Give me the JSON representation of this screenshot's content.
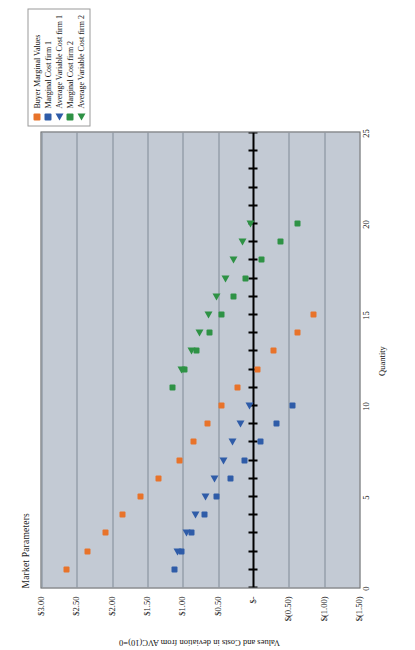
{
  "chart_data": {
    "type": "scatter",
    "title": "Market Parameters",
    "xlabel": "Quantity",
    "ylabel": "Values and Costs in deviation from AVC(10)=0",
    "xlim": [
      0,
      25
    ],
    "ylim": [
      -1.5,
      3.0
    ],
    "xticks": [
      "0",
      "5",
      "10",
      "15",
      "20",
      "25"
    ],
    "xtick_values": [
      0,
      5,
      10,
      15,
      20,
      25
    ],
    "yticks": [
      "$3.00",
      "$2.50",
      "$2.00",
      "$1.50",
      "$1.00",
      "$0.50",
      "$-",
      "$(0.50)",
      "$(1.00)",
      "$(1.50)"
    ],
    "ytick_values": [
      3.0,
      2.5,
      2.0,
      1.5,
      1.0,
      0.5,
      0.0,
      -0.5,
      -1.0,
      -1.5
    ],
    "grid": "horizontal-gridlines-only",
    "zero_line": 0.0,
    "legend_position": "top-right",
    "plot_background": "#c3cad4",
    "series": [
      {
        "name": "Buyer Marginal Values",
        "marker": "square",
        "color": "#e8732a",
        "points": [
          {
            "x": 1,
            "y": 2.65
          },
          {
            "x": 2,
            "y": 2.35
          },
          {
            "x": 3,
            "y": 2.1
          },
          {
            "x": 4,
            "y": 1.85
          },
          {
            "x": 5,
            "y": 1.6
          },
          {
            "x": 6,
            "y": 1.35
          },
          {
            "x": 7,
            "y": 1.05
          },
          {
            "x": 8,
            "y": 0.85
          },
          {
            "x": 9,
            "y": 0.65
          },
          {
            "x": 10,
            "y": 0.45
          },
          {
            "x": 11,
            "y": 0.22
          },
          {
            "x": 12,
            "y": -0.05
          },
          {
            "x": 13,
            "y": -0.28
          },
          {
            "x": 14,
            "y": -0.62
          },
          {
            "x": 15,
            "y": -0.85
          }
        ]
      },
      {
        "name": "Marginal Cost firm 1",
        "marker": "square",
        "color": "#2f5ca8",
        "points": [
          {
            "x": 1,
            "y": 1.12
          },
          {
            "x": 2,
            "y": 1.02
          },
          {
            "x": 3,
            "y": 0.88
          },
          {
            "x": 4,
            "y": 0.7
          },
          {
            "x": 5,
            "y": 0.52
          },
          {
            "x": 6,
            "y": 0.32
          },
          {
            "x": 7,
            "y": 0.13
          },
          {
            "x": 8,
            "y": -0.1
          },
          {
            "x": 9,
            "y": -0.32
          },
          {
            "x": 10,
            "y": -0.55
          }
        ]
      },
      {
        "name": "Average Variable Cost firm 1",
        "marker": "triangle",
        "color": "#2f5ca8",
        "points": [
          {
            "x": 2,
            "y": 1.08
          },
          {
            "x": 3,
            "y": 0.95
          },
          {
            "x": 4,
            "y": 0.82
          },
          {
            "x": 5,
            "y": 0.68
          },
          {
            "x": 6,
            "y": 0.55
          },
          {
            "x": 7,
            "y": 0.42
          },
          {
            "x": 8,
            "y": 0.3
          },
          {
            "x": 9,
            "y": 0.18
          },
          {
            "x": 10,
            "y": 0.06
          }
        ]
      },
      {
        "name": "Marginal Cost firm 2",
        "marker": "square",
        "color": "#2e9245",
        "points": [
          {
            "x": 11,
            "y": 1.15
          },
          {
            "x": 12,
            "y": 0.98
          },
          {
            "x": 13,
            "y": 0.8
          },
          {
            "x": 14,
            "y": 0.62
          },
          {
            "x": 15,
            "y": 0.45
          },
          {
            "x": 16,
            "y": 0.28
          },
          {
            "x": 17,
            "y": 0.12
          },
          {
            "x": 18,
            "y": -0.12
          },
          {
            "x": 19,
            "y": -0.38
          },
          {
            "x": 20,
            "y": -0.62
          }
        ]
      },
      {
        "name": "Average Variable Cost firm 2",
        "marker": "triangle",
        "color": "#2e9245",
        "points": [
          {
            "x": 12,
            "y": 1.02
          },
          {
            "x": 13,
            "y": 0.88
          },
          {
            "x": 14,
            "y": 0.76
          },
          {
            "x": 15,
            "y": 0.64
          },
          {
            "x": 16,
            "y": 0.52
          },
          {
            "x": 17,
            "y": 0.4
          },
          {
            "x": 18,
            "y": 0.28
          },
          {
            "x": 19,
            "y": 0.16
          },
          {
            "x": 20,
            "y": 0.04
          }
        ]
      }
    ]
  }
}
